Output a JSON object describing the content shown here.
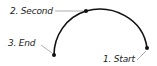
{
  "diagram": {
    "type": "three-point-arc",
    "colors": {
      "arc": "#111111",
      "leader": "#9a9a9a",
      "point": "#111111",
      "text": "#222222",
      "background": "#ffffff"
    },
    "points": [
      {
        "label": "1. Start",
        "x": 147,
        "y": 48
      },
      {
        "label": "2. Second",
        "x": 86,
        "y": 11
      },
      {
        "label": "3. End",
        "x": 54,
        "y": 55
      }
    ]
  }
}
